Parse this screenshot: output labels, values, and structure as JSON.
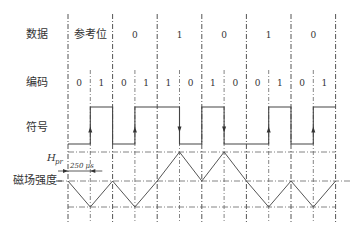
{
  "labels": {
    "data": "数据",
    "code": "编码",
    "symbol": "符号",
    "field": "磁场强度",
    "h_main": "H",
    "h_sub": "pr",
    "period": "250 μs"
  },
  "data_bits": [
    "参考位",
    "0",
    "1",
    "0",
    "1",
    "0"
  ],
  "code_bits": [
    "0",
    "1",
    "0",
    "1",
    "1",
    "0",
    "1",
    "0",
    "0",
    "1",
    "0",
    "1"
  ],
  "symbol_levels": [
    0,
    1,
    0,
    1,
    1,
    0,
    1,
    0,
    0,
    1,
    0,
    1
  ],
  "symbol_arrows": [
    {
      "at_boundary": 1,
      "dir": "up"
    },
    {
      "at_boundary": 3,
      "dir": "up"
    },
    {
      "at_boundary": 5,
      "dir": "down"
    },
    {
      "at_boundary": 7,
      "dir": "down"
    },
    {
      "at_boundary": 9,
      "dir": "up"
    },
    {
      "at_boundary": 11,
      "dir": "up"
    }
  ],
  "field_levels": [
    0,
    -1,
    0,
    -1,
    0,
    1,
    0,
    1,
    0,
    -1,
    0,
    -1,
    0
  ]
}
